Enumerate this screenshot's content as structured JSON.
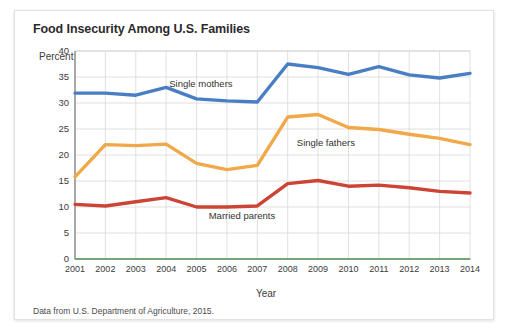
{
  "card": {
    "title": "Food Insecurity Among U.S. Families",
    "source_note": "Data from U.S. Department of Agriculture, 2015."
  },
  "chart_data": {
    "type": "line",
    "title": "Food Insecurity Among U.S. Families",
    "xlabel": "Year",
    "ylabel": "Percent",
    "categories": [
      "2001",
      "2002",
      "2003",
      "2004",
      "2005",
      "2006",
      "2007",
      "2008",
      "2009",
      "2010",
      "2011",
      "2012",
      "2013",
      "2014"
    ],
    "xlim": [
      2001,
      2014
    ],
    "ylim": [
      0,
      40
    ],
    "yticks": [
      0,
      5,
      10,
      15,
      20,
      25,
      30,
      35,
      40
    ],
    "grid": true,
    "legend": "inline-labels",
    "series": [
      {
        "name": "Single mothers",
        "color": "#4a7ec4",
        "values": [
          31.9,
          31.9,
          31.5,
          33.0,
          30.8,
          30.4,
          30.2,
          37.5,
          36.8,
          35.5,
          37.0,
          35.4,
          34.8,
          35.7
        ],
        "label_x": 2004.1,
        "label_y": 33.6
      },
      {
        "name": "Single fathers",
        "color": "#f0a848",
        "values": [
          15.8,
          22.0,
          21.8,
          22.1,
          18.4,
          17.2,
          18.0,
          27.3,
          27.8,
          25.3,
          24.9,
          24.0,
          23.2,
          22.0
        ],
        "label_x": 2008.3,
        "label_y": 22.4
      },
      {
        "name": "Married parents",
        "color": "#cc4436",
        "values": [
          10.5,
          10.2,
          11.0,
          11.8,
          10.0,
          10.0,
          10.2,
          14.5,
          15.1,
          14.0,
          14.2,
          13.7,
          13.0,
          12.7
        ],
        "label_x": 2005.4,
        "label_y": 8.2
      },
      {
        "name": "baseline",
        "color": "#5aa85a",
        "values": [
          0,
          0,
          0,
          0,
          0,
          0,
          0,
          0,
          0,
          0,
          0,
          0,
          0,
          0
        ],
        "label_x": null,
        "label_y": null
      }
    ]
  }
}
